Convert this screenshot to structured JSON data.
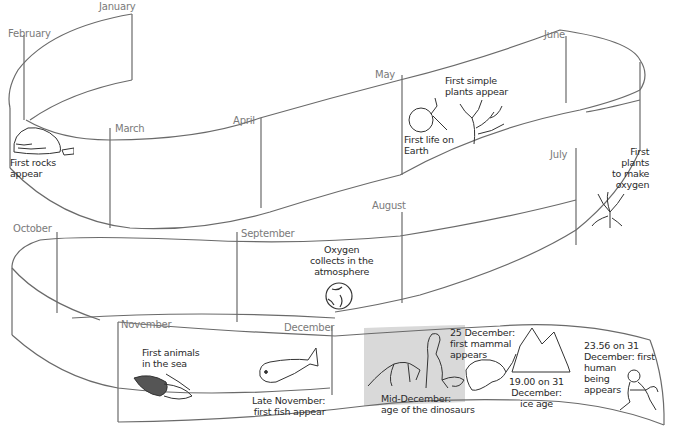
{
  "diagram": {
    "type": "timeline-ribbon",
    "stroke_color": "#6a6a6a",
    "shade_color": "#d9d9d9",
    "months": [
      {
        "label": "January"
      },
      {
        "label": "February"
      },
      {
        "label": "March"
      },
      {
        "label": "April"
      },
      {
        "label": "May"
      },
      {
        "label": "June"
      },
      {
        "label": "July"
      },
      {
        "label": "August"
      },
      {
        "label": "September"
      },
      {
        "label": "October"
      },
      {
        "label": "November"
      },
      {
        "label": "December"
      }
    ],
    "events": [
      {
        "lines": [
          "First rocks",
          "appear"
        ],
        "illustration": "rocks-icon"
      },
      {
        "lines": [
          "First life on",
          "Earth"
        ],
        "illustration": "cell-icon"
      },
      {
        "lines": [
          "First simple",
          "plants appear"
        ],
        "illustration": "simple-plant-icon"
      },
      {
        "lines": [
          "First",
          "plants",
          "to make",
          "oxygen"
        ],
        "illustration": "oxygen-plant-icon"
      },
      {
        "lines": [
          "Oxygen",
          "collects in the",
          "atmosphere"
        ],
        "illustration": "globe-icon"
      },
      {
        "lines": [
          "First animals",
          "in the sea"
        ],
        "illustration": "trilobite-icon"
      },
      {
        "lines": [
          "Late November:",
          "first fish appear"
        ],
        "illustration": "fish-icon"
      },
      {
        "lines": [
          "Mid-December:",
          "age of the dinosaurs"
        ],
        "illustration": "dinosaurs-icon"
      },
      {
        "lines": [
          "25 December:",
          "first mammal",
          "appears"
        ],
        "illustration": "mammal-icon"
      },
      {
        "lines": [
          "19.00 on 31",
          "December:",
          "ice age"
        ],
        "illustration": "iceberg-icon"
      },
      {
        "lines": [
          "23.56 on 31",
          "December: first",
          "human",
          "being",
          "appears"
        ],
        "illustration": "human-icon"
      }
    ]
  }
}
